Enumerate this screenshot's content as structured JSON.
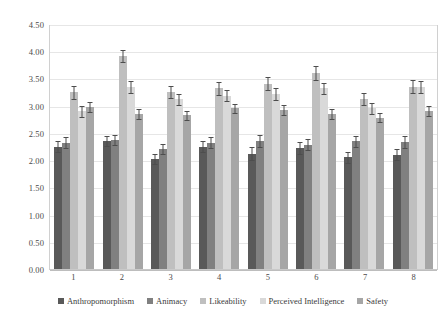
{
  "chart_data": {
    "type": "bar",
    "title": "",
    "subtitle": "",
    "xlabel": "",
    "ylabel": "",
    "categories": [
      "1",
      "2",
      "3",
      "4",
      "5",
      "6",
      "7",
      "8"
    ],
    "ylim": [
      0.0,
      4.5
    ],
    "ytick_labels": [
      "4.50",
      "4.00",
      "3.50",
      "3.00",
      "2.50",
      "2.00",
      "1.50",
      "1.00",
      "0.50",
      "0.00"
    ],
    "ytick_values": [
      4.5,
      4.0,
      3.5,
      3.0,
      2.5,
      2.0,
      1.5,
      1.0,
      0.5,
      0.0
    ],
    "grid": true,
    "grid_axis": "y",
    "legend_position": "bottom",
    "error_bars": true,
    "series": [
      {
        "name": "Anthropomorphism",
        "color": "#595959",
        "values": [
          2.25,
          2.35,
          2.02,
          2.25,
          2.12,
          2.22,
          2.05,
          2.1
        ],
        "errors": [
          0.1,
          0.09,
          0.1,
          0.1,
          0.12,
          0.11,
          0.1,
          0.1
        ]
      },
      {
        "name": "Animacy",
        "color": "#808080",
        "values": [
          2.32,
          2.37,
          2.2,
          2.32,
          2.35,
          2.28,
          2.35,
          2.33
        ],
        "errors": [
          0.1,
          0.09,
          0.09,
          0.1,
          0.11,
          0.1,
          0.1,
          0.11
        ]
      },
      {
        "name": "Likeability",
        "color": "#bfbfbf",
        "values": [
          3.25,
          3.92,
          3.25,
          3.32,
          3.4,
          3.6,
          3.12,
          3.35
        ],
        "errors": [
          0.12,
          0.11,
          0.11,
          0.12,
          0.12,
          0.12,
          0.11,
          0.12
        ]
      },
      {
        "name": "Perceived Intelligence",
        "color": "#d9d9d9",
        "values": [
          2.9,
          3.35,
          3.12,
          3.18,
          3.22,
          3.32,
          2.95,
          3.35
        ],
        "errors": [
          0.1,
          0.11,
          0.1,
          0.1,
          0.11,
          0.1,
          0.1,
          0.11
        ]
      },
      {
        "name": "Safety",
        "color": "#a6a6a6",
        "values": [
          2.97,
          2.85,
          2.82,
          2.95,
          2.92,
          2.85,
          2.78,
          2.9
        ],
        "errors": [
          0.09,
          0.09,
          0.09,
          0.09,
          0.09,
          0.09,
          0.08,
          0.09
        ]
      }
    ]
  }
}
